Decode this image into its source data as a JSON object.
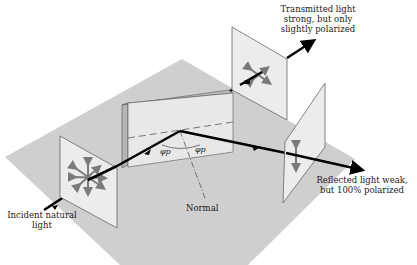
{
  "labels": {
    "transmitted": [
      "Transmitted light",
      "strong, but only",
      "slightly polarized"
    ],
    "reflected": [
      "Reflected light weak,",
      "but 100% polarized"
    ],
    "incident": [
      "Incident natural",
      "light"
    ],
    "normal": "Normal",
    "angle_left": "φp",
    "angle_right": "φp"
  },
  "colors": {
    "floor": "#cfcfcf",
    "screen": "#ececec",
    "screen_edge": "#555555",
    "glass_front": "#e6e6e6",
    "glass_side": "#b5b5b5",
    "ray": "#000000",
    "polarization_arrows": "#7a7a7a"
  },
  "elements": {
    "incident_screen": "natural light, all polarizations",
    "glass_block": "dielectric surface",
    "transmitted_screen": "partially polarized",
    "reflected_screen": "fully polarized (vertical)"
  }
}
